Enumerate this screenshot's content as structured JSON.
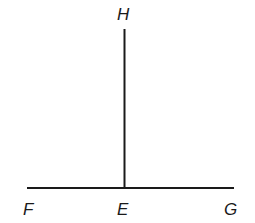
{
  "diagram": {
    "points": {
      "H": {
        "label": "H",
        "x": 124,
        "y": 29
      },
      "E": {
        "label": "E",
        "x": 124,
        "y": 188
      },
      "F": {
        "label": "F",
        "x": 27,
        "y": 188
      },
      "G": {
        "label": "G",
        "x": 234,
        "y": 188
      }
    },
    "segments": [
      {
        "from": "F",
        "to": "G"
      },
      {
        "from": "E",
        "to": "H"
      }
    ],
    "labels": {
      "H": "H",
      "F": "F",
      "E": "E",
      "G": "G"
    },
    "stroke_color": "#1a1a1a"
  }
}
